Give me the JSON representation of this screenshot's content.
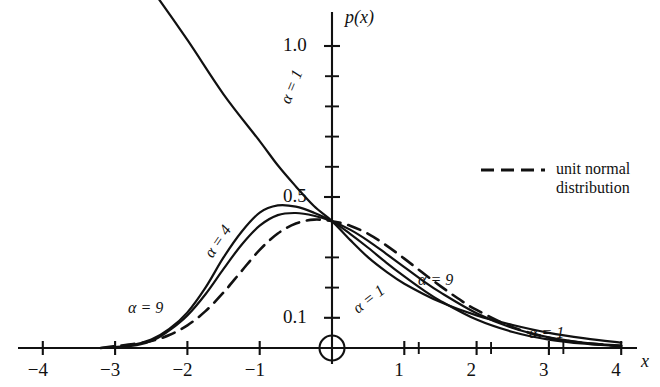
{
  "chart_data": {
    "type": "line",
    "title": "",
    "xlabel": "x",
    "ylabel": "p(x)",
    "xlim": [
      -4,
      4
    ],
    "ylim": [
      0,
      1.12
    ],
    "grid": false,
    "legend_position": "right",
    "x_ticks": [
      -4,
      -3,
      -2,
      -1,
      1,
      2,
      3,
      4
    ],
    "x_tick_labels": [
      "−4",
      "−3",
      "−2",
      "−1",
      "1",
      "2",
      "3",
      "4"
    ],
    "y_ticks": [
      0.1,
      0.5,
      1.0
    ],
    "y_tick_labels": [
      "0.1",
      "0.5",
      "1.0"
    ],
    "y_minor_ticks": [
      0.2,
      0.3,
      0.6,
      0.7,
      0.8,
      0.9
    ],
    "x_minor_ticks": [
      1.2,
      2.2,
      3.2
    ],
    "origin_marker": "open-circle",
    "series": [
      {
        "name": "α = 1",
        "style": "solid",
        "label_positions": [
          "upper-left",
          "lower-right",
          "far-right"
        ],
        "points": [
          [
            -4,
            1.95
          ],
          [
            -3.5,
            1.62
          ],
          [
            -3,
            1.35
          ],
          [
            -2.5,
            1.19
          ],
          [
            -2,
            1.02
          ],
          [
            -1.5,
            0.84
          ],
          [
            -1,
            0.685
          ],
          [
            -0.75,
            0.605
          ],
          [
            -0.5,
            0.535
          ],
          [
            -0.25,
            0.47
          ],
          [
            0,
            0.42
          ],
          [
            0.25,
            0.358
          ],
          [
            0.5,
            0.3
          ],
          [
            0.75,
            0.253
          ],
          [
            1,
            0.213
          ],
          [
            1.5,
            0.152
          ],
          [
            2,
            0.108
          ],
          [
            2.5,
            0.076
          ],
          [
            3,
            0.05
          ],
          [
            3.5,
            0.032
          ],
          [
            4,
            0.018
          ]
        ]
      },
      {
        "name": "α = 4",
        "style": "solid",
        "label_positions": [
          "left-peak"
        ],
        "points": [
          [
            -3.2,
            0.0
          ],
          [
            -2.8,
            0.008
          ],
          [
            -2.5,
            0.028
          ],
          [
            -2.25,
            0.063
          ],
          [
            -2,
            0.118
          ],
          [
            -1.75,
            0.2
          ],
          [
            -1.5,
            0.3
          ],
          [
            -1.25,
            0.385
          ],
          [
            -1,
            0.448
          ],
          [
            -0.75,
            0.472
          ],
          [
            -0.5,
            0.468
          ],
          [
            -0.25,
            0.448
          ],
          [
            0,
            0.42
          ],
          [
            0.25,
            0.378
          ],
          [
            0.5,
            0.332
          ],
          [
            0.75,
            0.283
          ],
          [
            1,
            0.237
          ],
          [
            1.25,
            0.194
          ],
          [
            1.5,
            0.156
          ],
          [
            2,
            0.094
          ],
          [
            2.5,
            0.053
          ],
          [
            3,
            0.028
          ],
          [
            3.5,
            0.014
          ],
          [
            4,
            0.006
          ]
        ]
      },
      {
        "name": "α = 9",
        "style": "solid",
        "label_positions": [
          "left-tail",
          "right-mid"
        ],
        "points": [
          [
            -3.1,
            0.0
          ],
          [
            -2.7,
            0.009
          ],
          [
            -2.45,
            0.028
          ],
          [
            -2.25,
            0.058
          ],
          [
            -2,
            0.108
          ],
          [
            -1.75,
            0.178
          ],
          [
            -1.5,
            0.262
          ],
          [
            -1.25,
            0.342
          ],
          [
            -1,
            0.405
          ],
          [
            -0.75,
            0.44
          ],
          [
            -0.5,
            0.447
          ],
          [
            -0.25,
            0.438
          ],
          [
            0,
            0.42
          ],
          [
            0.25,
            0.392
          ],
          [
            0.5,
            0.355
          ],
          [
            0.75,
            0.312
          ],
          [
            1,
            0.268
          ],
          [
            1.25,
            0.224
          ],
          [
            1.5,
            0.184
          ],
          [
            2,
            0.115
          ],
          [
            2.5,
            0.066
          ],
          [
            3,
            0.035
          ],
          [
            3.5,
            0.017
          ],
          [
            4,
            0.008
          ]
        ]
      },
      {
        "name": "unit normal distribution",
        "style": "dashed",
        "label_positions": [
          "legend"
        ],
        "points": [
          [
            -3.2,
            0.0
          ],
          [
            -3,
            0.006
          ],
          [
            -2.75,
            0.013
          ],
          [
            -2.5,
            0.023
          ],
          [
            -2.25,
            0.043
          ],
          [
            -2,
            0.075
          ],
          [
            -1.75,
            0.122
          ],
          [
            -1.5,
            0.184
          ],
          [
            -1.25,
            0.255
          ],
          [
            -1,
            0.325
          ],
          [
            -0.75,
            0.379
          ],
          [
            -0.5,
            0.412
          ],
          [
            -0.25,
            0.425
          ],
          [
            0,
            0.42
          ],
          [
            0.25,
            0.405
          ],
          [
            0.5,
            0.378
          ],
          [
            0.75,
            0.34
          ],
          [
            1,
            0.296
          ],
          [
            1.25,
            0.25
          ],
          [
            1.5,
            0.205
          ],
          [
            1.75,
            0.163
          ],
          [
            2,
            0.126
          ],
          [
            2.5,
            0.069
          ],
          [
            3,
            0.034
          ],
          [
            3.5,
            0.016
          ],
          [
            4,
            0.007
          ]
        ]
      }
    ],
    "annotations": [
      {
        "id": "alpha1-top",
        "text": "α = 1",
        "x": 285,
        "y": 95,
        "rotation": -68
      },
      {
        "id": "alpha4-left",
        "text": "α = 4",
        "x": 208,
        "y": 248,
        "rotation": -56
      },
      {
        "id": "alpha9-left",
        "text": "α = 9",
        "x": 128,
        "y": 300,
        "rotation": 0
      },
      {
        "id": "alpha1-right",
        "text": "α = 1",
        "x": 355,
        "y": 302,
        "rotation": -38
      },
      {
        "id": "alpha9-right",
        "text": "α = 9",
        "x": 418,
        "y": 272,
        "rotation": 0
      },
      {
        "id": "alpha1-far-right",
        "text": "α = 1",
        "x": 529,
        "y": 325,
        "rotation": 0
      }
    ],
    "legend": {
      "swatch": "dashed-line",
      "line1": "unit normal",
      "line2": "distribution"
    }
  }
}
